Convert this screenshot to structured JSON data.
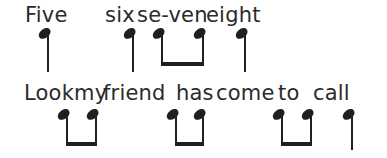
{
  "page": {
    "background": "#ffffff",
    "ink": "#1f1f1f",
    "text_color": "#2b2b2b"
  },
  "lines": [
    {
      "lyrics_text": "Five six se-ven eight",
      "text_top": 2,
      "lyric_words": [
        {
          "text": "Five",
          "x": 25
        },
        {
          "text": "six",
          "x": 105
        },
        {
          "text": "se-ven",
          "x": 137
        },
        {
          "text": "eight",
          "x": 206
        }
      ],
      "geometry": {
        "notehead_top": 29,
        "stem_bottom": 72,
        "beam_bottom": 66
      },
      "notes": [
        {
          "kind": "quarter",
          "stem_x": 48
        },
        {
          "kind": "quarter",
          "stem_x": 133
        },
        {
          "kind": "eighth-pair",
          "stem_x1": 162,
          "stem_x2": 203
        },
        {
          "kind": "quarter",
          "stem_x": 245
        }
      ]
    },
    {
      "lyrics_text": "Look my friend has come to call",
      "text_top": 80,
      "lyric_words": [
        {
          "text": "Look",
          "x": 24
        },
        {
          "text": "my",
          "x": 74
        },
        {
          "text": "friend",
          "x": 103
        },
        {
          "text": "has",
          "x": 176
        },
        {
          "text": "come",
          "x": 216
        },
        {
          "text": "to",
          "x": 278
        },
        {
          "text": "call",
          "x": 313
        }
      ],
      "geometry": {
        "notehead_top": 110,
        "stem_bottom": 150,
        "beam_bottom": 146
      },
      "notes": [
        {
          "kind": "eighth-pair",
          "stem_x1": 67,
          "stem_x2": 96
        },
        {
          "kind": "eighth-pair",
          "stem_x1": 176,
          "stem_x2": 203
        },
        {
          "kind": "eighth-pair",
          "stem_x1": 282,
          "stem_x2": 311
        },
        {
          "kind": "quarter",
          "stem_x": 352
        }
      ]
    }
  ]
}
